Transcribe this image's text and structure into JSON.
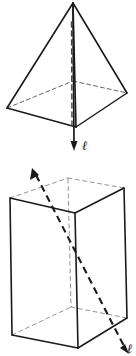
{
  "figure": {
    "background_color": "#ffffff",
    "ink_color": "#1a1a1a",
    "labels": {
      "pyramid_axis_label": "ℓ",
      "prism_axis_label": "ℓ"
    },
    "shapes": [
      {
        "name": "square-pyramid",
        "type": "pyramid",
        "base": "square",
        "apex": [
          73,
          3
        ],
        "base_vertices": {
          "left": [
            7,
            108
          ],
          "front": [
            76,
            127
          ],
          "right": [
            127,
            93
          ],
          "back": [
            73,
            81
          ]
        },
        "hidden_edges": [
          "left-back",
          "back-right"
        ],
        "axis": {
          "name": "vertical-axis",
          "type": "line-with-arrowhead",
          "from": [
            73,
            3
          ],
          "to": [
            74,
            150
          ],
          "style": "solid-with-dashed-interior",
          "arrow_direction": "down",
          "label": "ℓ"
        }
      },
      {
        "name": "rectangular-prism",
        "type": "prism",
        "base": "rectangle",
        "top_vertices": {
          "left": [
            10,
            198
          ],
          "front": [
            75,
            213
          ],
          "right": [
            124,
            188
          ],
          "back": [
            68,
            178
          ]
        },
        "bottom_vertices": {
          "left": [
            12,
            335
          ],
          "front": [
            88,
            348
          ],
          "right": [
            127,
            318
          ],
          "back": [
            77,
            305
          ]
        },
        "hidden_edges": [
          "back-vertical",
          "back-top-left",
          "back-top-right",
          "back-bottom-left",
          "back-bottom-right"
        ],
        "axis": {
          "name": "diagonal-axis",
          "type": "dashed-line-with-two-arrowheads",
          "from": [
            33,
            170
          ],
          "to": [
            127,
            352
          ],
          "style": "dashed",
          "arrow_direction": "both",
          "label": "ℓ"
        }
      }
    ]
  }
}
